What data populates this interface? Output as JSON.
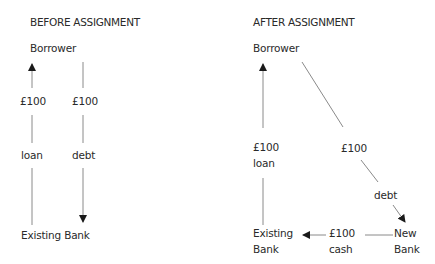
{
  "before": {
    "title": "BEFORE ASSIGNMENT",
    "borrower": "Borrower",
    "loan_amount": "£100",
    "debt_amount": "£100",
    "loan_label": "loan",
    "debt_label": "debt",
    "bank": "Existing Bank"
  },
  "after": {
    "title": "AFTER ASSIGNMENT",
    "borrower": "Borrower",
    "loan_amount": "£100",
    "loan_label": "loan",
    "debt_amount": "£100",
    "debt_label": "debt",
    "existing_bank_line1": "Existing",
    "existing_bank_line2": "Bank",
    "cash_amount": "£100",
    "cash_label": "cash",
    "new_bank_line1": "New",
    "new_bank_line2": "Bank"
  },
  "colors": {
    "line": "#8a8a8a",
    "arrowhead": "#1a1a1a",
    "text": "#2a2a2a"
  }
}
